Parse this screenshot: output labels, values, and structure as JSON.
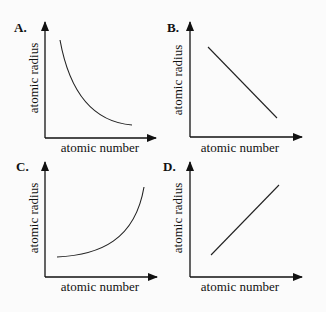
{
  "panels": [
    {
      "letter": "A.",
      "xlabel": "atomic number",
      "ylabel": "atomic radius",
      "shape": "decreasing-curve"
    },
    {
      "letter": "B.",
      "xlabel": "atomic number",
      "ylabel": "atomic radius",
      "shape": "decreasing-line"
    },
    {
      "letter": "C.",
      "xlabel": "atomic number",
      "ylabel": "atomic radius",
      "shape": "increasing-curve"
    },
    {
      "letter": "D.",
      "xlabel": "atomic number",
      "ylabel": "atomic radius",
      "shape": "increasing-line"
    }
  ],
  "colors": {
    "ink": "#111111",
    "background": "#fbfbfb"
  }
}
